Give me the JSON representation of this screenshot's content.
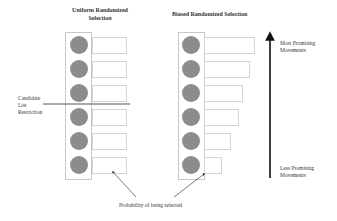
{
  "left_panel": {
    "title_line1": "Uniform Randomized",
    "title_line2": "Selection",
    "rows": [
      {
        "bar_width": 35
      },
      {
        "bar_width": 35
      },
      {
        "bar_width": 35
      },
      {
        "bar_width": 35
      },
      {
        "bar_width": 35
      },
      {
        "bar_width": 35
      }
    ]
  },
  "right_panel": {
    "title": "Biased Randomized Selection",
    "rows": [
      {
        "bar_width": 51
      },
      {
        "bar_width": 46
      },
      {
        "bar_width": 39
      },
      {
        "bar_width": 35
      },
      {
        "bar_width": 27
      },
      {
        "bar_width": 18
      }
    ]
  },
  "candidate_list": {
    "line1": "Candidate",
    "line2": "List",
    "line3": "Restriction"
  },
  "arrow_labels": {
    "top_line1": "Most Promising",
    "top_line2": "Movements",
    "bottom_line1": "Less Promising",
    "bottom_line2": "Movements"
  },
  "probability_label": "Probability of being selected",
  "colors": {
    "circle": "#8c8c8c",
    "box_border": "#c8c8c8",
    "arrow": "#111111"
  }
}
